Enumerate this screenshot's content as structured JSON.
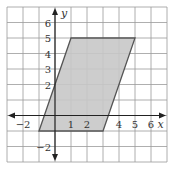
{
  "chart_data": {
    "type": "area",
    "title": "",
    "xlabel": "x",
    "ylabel": "y",
    "xlim": [
      -3,
      7
    ],
    "ylim": [
      -3,
      7
    ],
    "grid": true,
    "x_tick_labels": [
      "-2",
      "1",
      "2",
      "4",
      "5",
      "6"
    ],
    "x_tick_values": [
      -2,
      1,
      2,
      4,
      5,
      6
    ],
    "y_tick_labels": [
      "6",
      "5",
      "4",
      "3",
      "2",
      "-2"
    ],
    "y_tick_values": [
      6,
      5,
      4,
      3,
      2,
      -2
    ],
    "shape": {
      "name": "parallelogram",
      "vertices": [
        [
          -1,
          -1
        ],
        [
          1,
          5
        ],
        [
          5,
          5
        ],
        [
          3,
          -1
        ]
      ],
      "fill": "#c8c8c8",
      "stroke": "#555555"
    }
  },
  "colors": {
    "grid": "#9a9a9a",
    "axis": "#222222",
    "fill": "#c8c8c8",
    "stroke": "#555555"
  }
}
